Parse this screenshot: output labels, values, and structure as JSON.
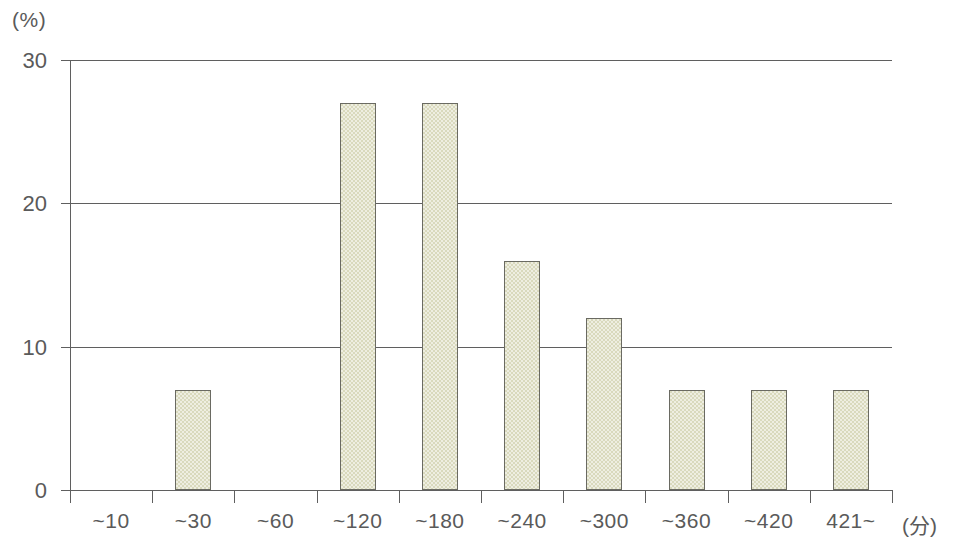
{
  "chart_data": {
    "type": "bar",
    "title": "",
    "subtitle": "",
    "xlabel": "(分)",
    "ylabel": "(%)",
    "categories": [
      "~10",
      "~30",
      "~60",
      "~120",
      "~180",
      "~240",
      "~300",
      "~360",
      "~420",
      "421~"
    ],
    "values": [
      0,
      7,
      0,
      27,
      27,
      16,
      12,
      7,
      7,
      7
    ],
    "ylim": [
      0,
      30
    ],
    "yticks": [
      0,
      10,
      20,
      30
    ],
    "ytick_labels": [
      "0",
      "10",
      "20",
      "30"
    ],
    "grid": "horizontal",
    "legend": "none",
    "bar_color": "#D9D9BD",
    "bar_border_color": "#6A6A62",
    "axis_color": "#5F5F5F",
    "background_color": "#FFFFFF"
  },
  "axes": {
    "y_unit_label": "(%)",
    "x_unit_label": "(分)"
  }
}
